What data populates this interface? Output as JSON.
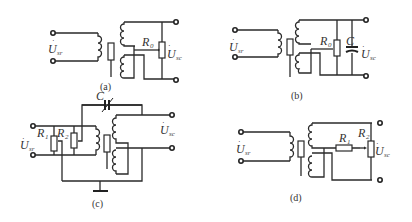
{
  "figure": {
    "panels": [
      {
        "id": "a",
        "caption": "(a)",
        "input_label": "U",
        "input_sub": "sr",
        "output_label": "U",
        "output_sub": "sc",
        "components": [
          {
            "label": "R",
            "sub": "0"
          }
        ]
      },
      {
        "id": "b",
        "caption": "(b)",
        "input_label": "U",
        "input_sub": "sr",
        "output_label": "U",
        "output_sub": "sc",
        "components": [
          {
            "label": "R",
            "sub": "0"
          },
          {
            "label": "C",
            "sub": ""
          }
        ]
      },
      {
        "id": "c",
        "caption": "(c)",
        "input_label": "U",
        "input_sub": "sr",
        "output_label": "U",
        "output_sub": "sc",
        "components": [
          {
            "label": "C",
            "sub": ""
          },
          {
            "label": "R",
            "sub": "1"
          },
          {
            "label": "R",
            "sub": "2"
          }
        ]
      },
      {
        "id": "d",
        "caption": "(d)",
        "input_label": "U",
        "input_sub": "sr",
        "output_label": "U",
        "output_sub": "sc",
        "components": [
          {
            "label": "R",
            "sub": "1"
          },
          {
            "label": "R",
            "sub": "2"
          }
        ]
      }
    ]
  }
}
